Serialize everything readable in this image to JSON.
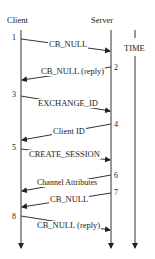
{
  "actors": {
    "client": "Client",
    "server": "Server",
    "time": "TIME"
  },
  "steps": [
    {
      "n": "1",
      "label": "CB_NULL",
      "dir": "client-to-server"
    },
    {
      "n": "2",
      "label": "CB_NULL (reply)",
      "dir": "server-to-client"
    },
    {
      "n": "3",
      "label": "EXCHANGE_ID",
      "dir": "client-to-server"
    },
    {
      "n": "4",
      "label": "Client ID",
      "dir": "server-to-client"
    },
    {
      "n": "5",
      "label": "CREATE_SESSION",
      "dir": "client-to-server"
    },
    {
      "n": "6",
      "label": "Channel Attributes",
      "dir": "server-to-client"
    },
    {
      "n": "7",
      "label": "CB_NULL",
      "dir": "server-to-client"
    },
    {
      "n": "8",
      "label": "CB_NULL (reply)",
      "dir": "client-to-server"
    }
  ]
}
